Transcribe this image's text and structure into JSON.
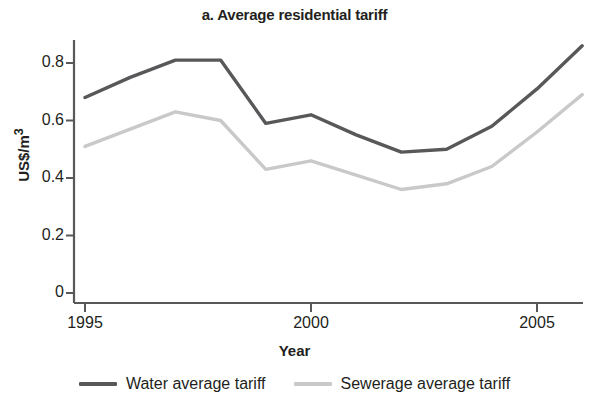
{
  "chart_data": {
    "type": "line",
    "title": "a. Average residential tariff",
    "xlabel": "Year",
    "ylabel": "US$/m",
    "ylabel_exponent": "3",
    "x": [
      1995,
      1996,
      1997,
      1998,
      1999,
      2000,
      2001,
      2002,
      2003,
      2004,
      2005,
      2006
    ],
    "xlim": [
      1995,
      2006
    ],
    "ylim": [
      0,
      0.9
    ],
    "xticks": [
      1995,
      2000,
      2005
    ],
    "xtick_labels": [
      "1995",
      "2000",
      "2005"
    ],
    "yticks": [
      0,
      0.2,
      0.4,
      0.6,
      0.8
    ],
    "ytick_labels": [
      "0",
      "0.2",
      "0.4",
      "0.6",
      "0.8"
    ],
    "grid": false,
    "legend_position": "bottom",
    "series": [
      {
        "name": "Water average tariff",
        "color": "#58585a",
        "values": [
          0.68,
          0.75,
          0.81,
          0.81,
          0.59,
          0.62,
          0.55,
          0.49,
          0.5,
          0.58,
          0.71,
          0.86
        ]
      },
      {
        "name": "Sewerage average tariff",
        "color": "#c9c9c9",
        "values": [
          0.51,
          0.57,
          0.63,
          0.6,
          0.43,
          0.46,
          0.41,
          0.36,
          0.38,
          0.44,
          0.56,
          0.69
        ]
      }
    ]
  },
  "axis": {
    "color": "#58585a"
  }
}
